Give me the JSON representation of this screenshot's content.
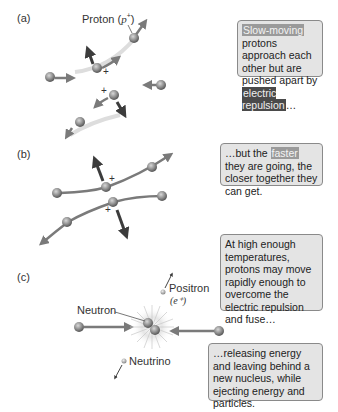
{
  "panels": {
    "a": {
      "label": "(a)",
      "proton_label_prefix": "Proton (",
      "proton_label_symbol": "p",
      "proton_label_sup": "+",
      "proton_label_suffix": ")",
      "charge_sign": "+",
      "box": {
        "highlight_1": "Slow-moving",
        "text_1": " protons approach each other but are pushed apart by ",
        "highlight_2": "electric repulsion",
        "text_2": "…"
      }
    },
    "b": {
      "label": "(b)",
      "charge_sign": "+",
      "box": {
        "text_1": "…but the ",
        "highlight_1": "faster",
        "text_2": " they are going, the closer together they can get."
      }
    },
    "c": {
      "label": "(c)",
      "positron_label": "Positron",
      "positron_symbol": "(e⁺)",
      "neutron_label": "Neutron",
      "neutrino_label": "Neutrino",
      "box_1": {
        "text": "At high enough temperatures, protons may move rapidly enough to overcome the electric repulsion and fuse…"
      },
      "box_2": {
        "text": "…releasing energy and leaving behind a new nucleus, while ejecting energy and particles."
      }
    }
  },
  "colors": {
    "particle": "#8a8a8a",
    "arrow": "#7a7a7a",
    "dark_arrow": "#3c3c3c",
    "box_bg": "#e4e4e4",
    "box_border": "#8a8a8a",
    "highlight_light": "#9a9a9a",
    "highlight_dark": "#4a4a4a"
  }
}
